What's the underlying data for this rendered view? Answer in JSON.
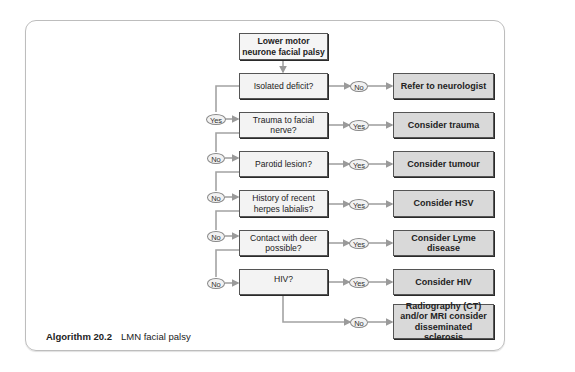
{
  "figure": {
    "caption_label": "Algorithm 20.2",
    "caption_text": "LMN facial palsy"
  },
  "start": {
    "label": "Lower motor neurone facial palsy"
  },
  "questions": [
    {
      "label": "Isolated deficit?"
    },
    {
      "label": "Trauma to facial nerve?"
    },
    {
      "label": "Parotid lesion?"
    },
    {
      "label": "History of recent herpes labialis?"
    },
    {
      "label": "Contact with deer possible?"
    },
    {
      "label": "HIV?"
    }
  ],
  "outcomes": [
    {
      "label": "Refer to neurologist"
    },
    {
      "label": "Consider trauma"
    },
    {
      "label": "Consider tumour"
    },
    {
      "label": "Consider HSV"
    },
    {
      "label": "Consider Lyme disease"
    },
    {
      "label": "Consider HIV"
    },
    {
      "label": "Radiography (CT) and/or MRI consider disseminated sclerosis"
    }
  ],
  "right_pills": [
    "No",
    "Yes",
    "Yes",
    "Yes",
    "Yes",
    "Yes",
    "No"
  ],
  "left_pills": [
    "Yes",
    "No",
    "No",
    "No",
    "No"
  ],
  "colors": {
    "question_fill": "#f3f3f3",
    "outcome_fill": "#d9d9d9",
    "connector": "#a0a0a0",
    "border": "#555555"
  }
}
